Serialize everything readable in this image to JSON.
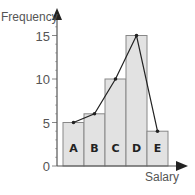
{
  "chart_data": {
    "type": "bar",
    "title": "",
    "xlabel": "Salary",
    "ylabel": "Frequency",
    "categories": [
      "A",
      "B",
      "C",
      "D",
      "E"
    ],
    "values": [
      5,
      6,
      10,
      15,
      4
    ],
    "series": [
      {
        "name": "Histogram",
        "type": "bar",
        "values": [
          5,
          6,
          10,
          15,
          4
        ]
      },
      {
        "name": "Frequency polygon",
        "type": "line",
        "values": [
          5,
          6,
          10,
          15,
          4
        ]
      }
    ],
    "yticks": [
      0,
      5,
      10,
      15
    ],
    "ylim": [
      0,
      16
    ],
    "minor_tick_step": 1,
    "grid": false,
    "legend": null
  },
  "colors": {
    "bar_fill": "#e2e2e2",
    "bar_stroke": "#888888",
    "axis": "#555555",
    "line": "#222222"
  }
}
